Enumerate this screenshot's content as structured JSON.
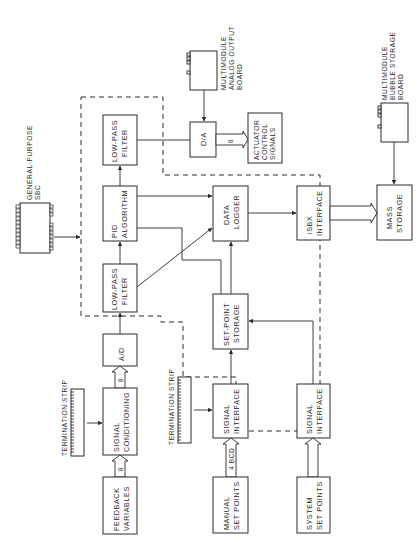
{
  "diagram": {
    "title": "",
    "orientation": "rotated 90 degrees counter-clockwise",
    "blocks": {
      "low_pass_filter_out": [
        "LOW-PASS",
        "FILTER"
      ],
      "d_a": [
        "D/A"
      ],
      "actuator": [
        "ACTUATOR",
        "CONTROL",
        "SIGNALS"
      ],
      "analog_output_board": [
        "MULTIMODULE",
        "ANALOG  OUTPUT",
        "BOARD"
      ],
      "pid": [
        "PID",
        "ALGORITHM"
      ],
      "data_logger": [
        "DATA",
        "LOGGER"
      ],
      "isbx": [
        "iSBX",
        "INTERFACE"
      ],
      "mass_storage": [
        "MASS",
        "STORAGE"
      ],
      "bubble_board": [
        "MULTIMODULE",
        "BUBBLE  STORAGE",
        "BOARD"
      ],
      "low_pass_filter_in": [
        "LOW-PASS",
        "FILTER"
      ],
      "set_point_storage": [
        "SET-POINT",
        "STORAGE"
      ],
      "a_d": [
        "A/D"
      ],
      "signal_conditioning": [
        "SIGNAL",
        "CONDITIONING"
      ],
      "feedback": [
        "FEEDBACK",
        "VARIABLES"
      ],
      "termination_strip_1": [
        "TERMINATION  STRIP"
      ],
      "termination_strip_2": [
        "TERMINATION  STRIP"
      ],
      "signal_interface_manual": [
        "SIGNAL",
        "INTERFACE"
      ],
      "manual_set_points": [
        "MANUAL",
        "SET  POINTS"
      ],
      "signal_interface_system": [
        "SIGNAL",
        "INTERFACE"
      ],
      "system_set_points": [
        "SYSTEM",
        "SET  POINTS"
      ],
      "sbc": [
        "GENERAL-PURPOSE",
        "SBC"
      ]
    },
    "bus_labels": {
      "feedback_to_conditioning": "8",
      "conditioning_to_ad": "8",
      "da_to_actuator": "8",
      "manual_to_interface": "4 BCD"
    },
    "connections": [
      {
        "from": "feedback",
        "to": "signal_conditioning",
        "type": "bus",
        "width": "8"
      },
      {
        "from": "termination_strip_1",
        "to": "signal_conditioning",
        "type": "arrow"
      },
      {
        "from": "signal_conditioning",
        "to": "a_d",
        "type": "bus",
        "width": "8"
      },
      {
        "from": "a_d",
        "to": "low_pass_filter_in",
        "type": "arrow"
      },
      {
        "from": "low_pass_filter_in",
        "to": "pid",
        "type": "arrow"
      },
      {
        "from": "low_pass_filter_in",
        "to": "data_logger",
        "type": "arrow"
      },
      {
        "from": "pid",
        "to": "low_pass_filter_out",
        "type": "arrow"
      },
      {
        "from": "pid",
        "to": "data_logger",
        "type": "arrow"
      },
      {
        "from": "pid",
        "to": "set_point_storage",
        "type": "line"
      },
      {
        "from": "low_pass_filter_out",
        "to": "d_a",
        "type": "line"
      },
      {
        "from": "analog_output_board",
        "to": "d_a",
        "type": "arrow"
      },
      {
        "from": "d_a",
        "to": "actuator",
        "type": "bus",
        "width": "8"
      },
      {
        "from": "set_point_storage",
        "to": "data_logger",
        "type": "arrow"
      },
      {
        "from": "data_logger",
        "to": "isbx",
        "type": "arrow"
      },
      {
        "from": "isbx",
        "to": "mass_storage",
        "type": "bus"
      },
      {
        "from": "bubble_board",
        "to": "mass_storage",
        "type": "arrow"
      },
      {
        "from": "manual_set_points",
        "to": "signal_interface_manual",
        "type": "bus",
        "width": "4 BCD"
      },
      {
        "from": "termination_strip_2",
        "to": "signal_interface_manual",
        "type": "arrow"
      },
      {
        "from": "signal_interface_manual",
        "to": "set_point_storage",
        "type": "arrow"
      },
      {
        "from": "system_set_points",
        "to": "signal_interface_system",
        "type": "bus"
      },
      {
        "from": "signal_interface_system",
        "to": "set_point_storage",
        "type": "arrow"
      },
      {
        "from": "sbc",
        "to": "sbc_boundary",
        "type": "arrow"
      }
    ]
  }
}
